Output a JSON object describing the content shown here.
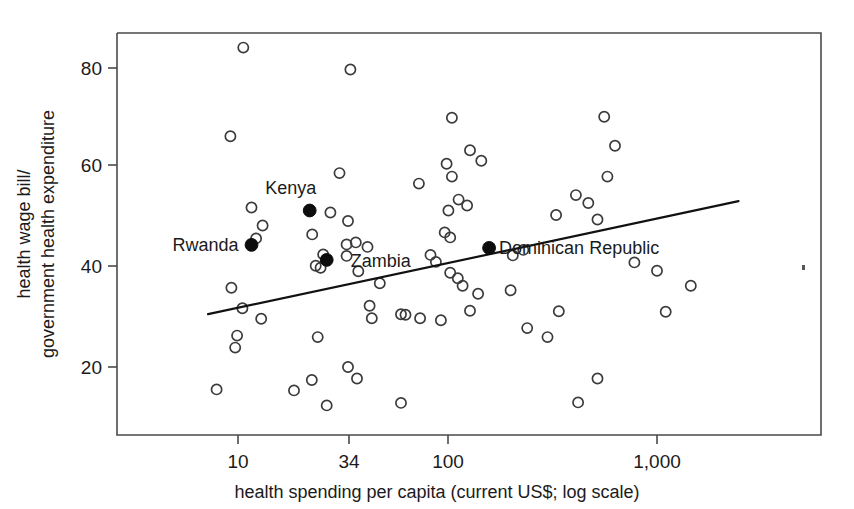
{
  "chart_data": {
    "type": "scatter",
    "title": "",
    "xlabel": "health spending per capita (current US$; log scale)",
    "ylabel": "health wage bill/ government health expenditure",
    "ylabel_line1": "health wage bill/",
    "ylabel_line2": "government health expenditure",
    "xscale": "log",
    "xticks": [
      10,
      34,
      100,
      1000
    ],
    "xtick_labels": [
      "10",
      "34",
      "100",
      "1,000"
    ],
    "yticks": [
      20,
      40,
      60,
      80
    ],
    "ytick_labels": [
      "20",
      "40",
      "60",
      "80"
    ],
    "xlim": [
      6.2,
      3050
    ],
    "ylim": [
      10.5,
      86.5
    ],
    "grid": false,
    "legend": null,
    "trendline": {
      "label": "fitted trend line",
      "x": [
        7.2,
        2450
      ],
      "y": [
        30.6,
        53.3
      ]
    },
    "series": [
      {
        "name": "countries",
        "marker": "open-circle",
        "points": [
          {
            "x": 10.6,
            "y": 84.1
          },
          {
            "x": 34.4,
            "y": 79.7
          },
          {
            "x": 9.2,
            "y": 66.3
          },
          {
            "x": 105,
            "y": 70.0
          },
          {
            "x": 560,
            "y": 70.2
          },
          {
            "x": 128,
            "y": 63.5
          },
          {
            "x": 630,
            "y": 64.4
          },
          {
            "x": 30.5,
            "y": 58.9
          },
          {
            "x": 99,
            "y": 60.8
          },
          {
            "x": 580,
            "y": 58.2
          },
          {
            "x": 105,
            "y": 58.2
          },
          {
            "x": 145,
            "y": 61.4
          },
          {
            "x": 11.6,
            "y": 52.0
          },
          {
            "x": 27.6,
            "y": 51.0
          },
          {
            "x": 73,
            "y": 56.8
          },
          {
            "x": 410,
            "y": 54.5
          },
          {
            "x": 470,
            "y": 52.9
          },
          {
            "x": 113,
            "y": 53.6
          },
          {
            "x": 124,
            "y": 52.4
          },
          {
            "x": 13.1,
            "y": 48.4
          },
          {
            "x": 33.5,
            "y": 49.3
          },
          {
            "x": 101,
            "y": 51.4
          },
          {
            "x": 330,
            "y": 50.5
          },
          {
            "x": 520,
            "y": 49.6
          },
          {
            "x": 12.2,
            "y": 45.8
          },
          {
            "x": 22.6,
            "y": 46.6
          },
          {
            "x": 36.5,
            "y": 45.0
          },
          {
            "x": 41.5,
            "y": 44.1
          },
          {
            "x": 33.0,
            "y": 44.6
          },
          {
            "x": 97,
            "y": 47.0
          },
          {
            "x": 103,
            "y": 46.0
          },
          {
            "x": 25.5,
            "y": 42.6
          },
          {
            "x": 33.0,
            "y": 42.3
          },
          {
            "x": 23.5,
            "y": 40.3
          },
          {
            "x": 24.8,
            "y": 39.9
          },
          {
            "x": 37.5,
            "y": 39.2
          },
          {
            "x": 83,
            "y": 42.5
          },
          {
            "x": 88,
            "y": 41.1
          },
          {
            "x": 205,
            "y": 42.4
          },
          {
            "x": 230,
            "y": 43.5
          },
          {
            "x": 780,
            "y": 41.0
          },
          {
            "x": 47.5,
            "y": 36.8
          },
          {
            "x": 9.3,
            "y": 35.9
          },
          {
            "x": 103,
            "y": 38.9
          },
          {
            "x": 112,
            "y": 37.8
          },
          {
            "x": 118,
            "y": 36.3
          },
          {
            "x": 1000,
            "y": 39.3
          },
          {
            "x": 10.5,
            "y": 31.8
          },
          {
            "x": 12.9,
            "y": 29.7
          },
          {
            "x": 60,
            "y": 30.6
          },
          {
            "x": 42.5,
            "y": 32.3
          },
          {
            "x": 43.5,
            "y": 29.8
          },
          {
            "x": 63,
            "y": 30.5
          },
          {
            "x": 74,
            "y": 29.8
          },
          {
            "x": 93,
            "y": 29.4
          },
          {
            "x": 128,
            "y": 31.3
          },
          {
            "x": 140,
            "y": 34.7
          },
          {
            "x": 200,
            "y": 35.4
          },
          {
            "x": 340,
            "y": 31.2
          },
          {
            "x": 1100,
            "y": 31.1
          },
          {
            "x": 1450,
            "y": 36.3
          },
          {
            "x": 9.9,
            "y": 26.3
          },
          {
            "x": 9.7,
            "y": 23.9
          },
          {
            "x": 24.0,
            "y": 26.0
          },
          {
            "x": 240,
            "y": 27.8
          },
          {
            "x": 300,
            "y": 26.0
          },
          {
            "x": 33.5,
            "y": 20.0
          },
          {
            "x": 37.0,
            "y": 17.7
          },
          {
            "x": 22.5,
            "y": 17.4
          },
          {
            "x": 520,
            "y": 17.7
          },
          {
            "x": 18.5,
            "y": 15.3
          },
          {
            "x": 7.9,
            "y": 15.5
          },
          {
            "x": 26.5,
            "y": 12.3
          },
          {
            "x": 60,
            "y": 12.8
          },
          {
            "x": 420,
            "y": 12.9
          }
        ]
      },
      {
        "name": "highlighted countries",
        "marker": "filled-circle",
        "points": [
          {
            "x": 22.0,
            "y": 51.4,
            "label": "Kenya",
            "label_dx": -19,
            "label_dy": -17,
            "label_anchor": "middle"
          },
          {
            "x": 11.6,
            "y": 44.5,
            "label": "Rwanda",
            "label_dx": -13,
            "label_dy": 6,
            "label_anchor": "end"
          },
          {
            "x": 26.5,
            "y": 41.5,
            "label": "Zambia",
            "label_dx": 24,
            "label_dy": 7,
            "label_anchor": "start"
          },
          {
            "x": 158,
            "y": 43.9,
            "label": "Dominican Republic",
            "label_dx": 10,
            "label_dy": 6,
            "label_anchor": "start"
          }
        ]
      }
    ],
    "annotations": [
      {
        "name": "ink-speck",
        "x": 802,
        "y": 265,
        "type": "pixel-artifact"
      }
    ]
  },
  "colors": {
    "background": "#ffffff",
    "axis": "#4a4a4a",
    "text": "#1b1b1b",
    "open_marker": "#3b3b3b",
    "filled_marker": "#0d0d0d",
    "trend_line": "#111111"
  }
}
